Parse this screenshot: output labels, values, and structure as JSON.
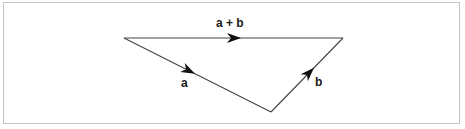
{
  "diagram": {
    "vectors": [
      {
        "id": "a",
        "label": "a",
        "from": "P",
        "to": "Q"
      },
      {
        "id": "b",
        "label": "b",
        "from": "Q",
        "to": "R"
      },
      {
        "id": "sum",
        "label": "a + b",
        "from": "P",
        "to": "R"
      }
    ],
    "colors": {
      "line": "#444444",
      "arrowhead": "#111111",
      "label": "#1a1a1a",
      "frame_border": "#c4c4c4"
    }
  }
}
